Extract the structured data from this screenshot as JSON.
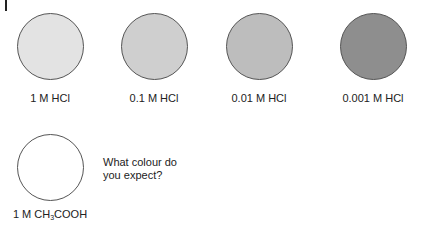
{
  "samples": [
    {
      "label": "1 M HCl",
      "color": "#e3e3e3"
    },
    {
      "label": "0.1 M HCl",
      "color": "#cfcfcf"
    },
    {
      "label": "0.01 M HCl",
      "color": "#bdbdbd"
    },
    {
      "label": "0.001 M HCl",
      "color": "#8e8e8e"
    }
  ],
  "unknown": {
    "label_prefix": "1 M CH",
    "label_sub": "3",
    "label_suffix": "COOH",
    "color": "#ffffff"
  },
  "question": {
    "line1": "What colour do",
    "line2": "you expect?"
  }
}
